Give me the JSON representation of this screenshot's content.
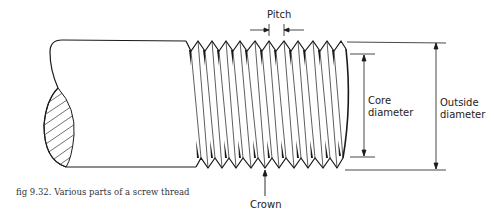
{
  "figure": {
    "caption": "fig 9.32. Various parts of a screw thread",
    "subject": "screw thread"
  },
  "labels": {
    "pitch": "Pitch",
    "crown": "Crown",
    "core_diameter_line1": "Core",
    "core_diameter_line2": "diameter",
    "outside_diameter_line1": "Outside",
    "outside_diameter_line2": "diameter"
  },
  "colors": {
    "line": "#1a1a1a",
    "background": "#ffffff"
  }
}
